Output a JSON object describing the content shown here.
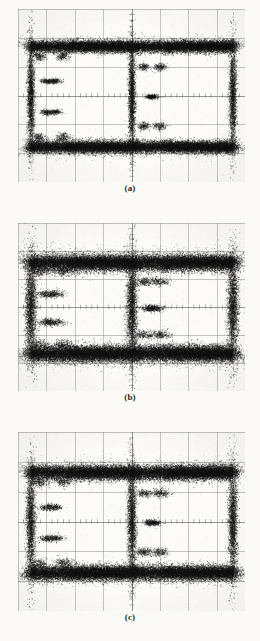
{
  "figure": {
    "type": "eye-diagram-photographs",
    "background_color": "#fbfaf7",
    "trace_color": "#1a1a1a",
    "grid_color": "#9a9a96",
    "panel_count": 3
  },
  "panels": [
    {
      "id": "panel-a",
      "caption": "(a)",
      "geometry": {
        "x": 18,
        "y": 9,
        "width": 227,
        "height": 173
      },
      "grid": {
        "cols": 8,
        "rows": 6,
        "ticks_per_division": 5,
        "center_axes": true
      },
      "chart_data": {
        "type": "scatter",
        "title": "(a)",
        "xlabel": "",
        "ylabel": "",
        "eye_openings": 2,
        "eye_height_fraction": 0.42,
        "eye_width_fraction": 0.46,
        "noise_level": 0.3,
        "jitter_level": 0.26,
        "point_count": 26000,
        "level_high_y": 0.215,
        "level_low_y": 0.795,
        "crossing_x": [
          0.055,
          0.5,
          0.945
        ],
        "xlim": [
          0,
          1
        ],
        "ylim": [
          0,
          1
        ],
        "grid": true,
        "legend": "none"
      }
    },
    {
      "id": "panel-b",
      "caption": "(b)",
      "geometry": {
        "x": 18,
        "y": 223,
        "width": 227,
        "height": 168
      },
      "grid": {
        "cols": 8,
        "rows": 6,
        "ticks_per_division": 5,
        "center_axes": true
      },
      "chart_data": {
        "type": "scatter",
        "title": "(b)",
        "xlabel": "",
        "ylabel": "",
        "eye_openings": 2,
        "eye_height_fraction": 0.3,
        "eye_width_fraction": 0.38,
        "noise_level": 0.46,
        "jitter_level": 0.4,
        "point_count": 30000,
        "level_high_y": 0.235,
        "level_low_y": 0.775,
        "crossing_x": [
          0.055,
          0.5,
          0.945
        ],
        "xlim": [
          0,
          1
        ],
        "ylim": [
          0,
          1
        ],
        "grid": true,
        "legend": "none"
      }
    },
    {
      "id": "panel-c",
      "caption": "(c)",
      "geometry": {
        "x": 18,
        "y": 432,
        "width": 227,
        "height": 179
      },
      "grid": {
        "cols": 8,
        "rows": 6,
        "ticks_per_division": 5,
        "center_axes": true
      },
      "chart_data": {
        "type": "scatter",
        "title": "(c)",
        "xlabel": "",
        "ylabel": "",
        "eye_openings": 2,
        "eye_height_fraction": 0.36,
        "eye_width_fraction": 0.42,
        "noise_level": 0.38,
        "jitter_level": 0.33,
        "point_count": 28000,
        "level_high_y": 0.225,
        "level_low_y": 0.785,
        "crossing_x": [
          0.055,
          0.5,
          0.945
        ],
        "xlim": [
          0,
          1
        ],
        "ylim": [
          0,
          1
        ],
        "grid": true,
        "legend": "none"
      }
    }
  ]
}
